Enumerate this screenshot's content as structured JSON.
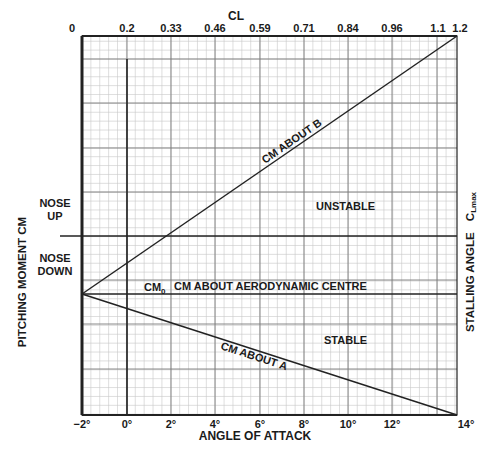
{
  "chart_data": {
    "type": "line",
    "title": "",
    "top_axis": {
      "label": "CL",
      "ticks": [
        "0",
        "0.2",
        "0.33",
        "0.46",
        "0.59",
        "0.71",
        "0.84",
        "0.96",
        "1.1",
        "1.2"
      ]
    },
    "bottom_axis": {
      "label": "ANGLE OF ATTACK",
      "ticks": [
        "−2°",
        "0°",
        "2°",
        "4°",
        "6°",
        "8°",
        "10°",
        "12°",
        "14°"
      ],
      "range": [
        -2,
        14.9
      ]
    },
    "left_axis": {
      "label": "PITCHING MOMENT CM",
      "regions": [
        {
          "line1": "NOSE",
          "line2": "UP"
        },
        {
          "line1": "NOSE",
          "line2": "DOWN"
        }
      ]
    },
    "right_axis": {
      "label": "STALLING ANGLE",
      "label_suffix": "C",
      "label_subscript": "Lmax"
    },
    "series": [
      {
        "name": "CM ABOUT B",
        "x": [
          -2,
          14.9
        ],
        "y_rel": [
          -0.58,
          5.8
        ],
        "note": "rises from CM0 to top right"
      },
      {
        "name": "CM ABOUT A",
        "x": [
          -2,
          14.9
        ],
        "y_rel": [
          -0.58,
          -4.0
        ],
        "note": "falls from CM0 to bottom right"
      },
      {
        "name": "CM0 CM ABOUT AERODYNAMIC CENTRE",
        "x": [
          -2,
          14.9
        ],
        "y_rel": [
          -0.58,
          -0.58
        ],
        "note": "constant horizontal line"
      }
    ],
    "annotations": {
      "cm0": "CM",
      "cm0_sub": "0",
      "ac_label": "CM ABOUT AERODYNAMIC CENTRE",
      "line_b": "CM ABOUT B",
      "line_a": "CM ABOUT A",
      "unstable": "UNSTABLE",
      "stable": "STABLE"
    },
    "grid": true
  }
}
